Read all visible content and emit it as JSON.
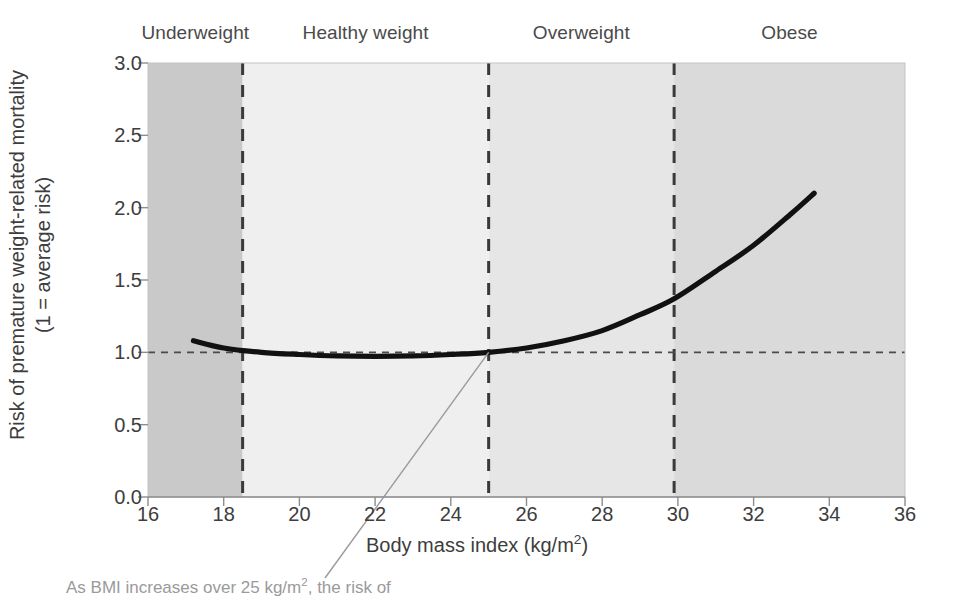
{
  "chart_data": {
    "type": "line",
    "title": "",
    "xlabel": "Body mass index (kg/m2)",
    "xlabel_base": "Body mass index (kg/m",
    "xlabel_sup": "2",
    "xlabel_tail": ")",
    "ylabel_line1": "Risk of premature weight-related mortality",
    "ylabel_line2": "(1 = average risk)",
    "xlim": [
      16,
      36
    ],
    "ylim": [
      0.0,
      3.0
    ],
    "xticks": [
      16,
      18,
      20,
      22,
      24,
      26,
      28,
      30,
      32,
      34,
      36
    ],
    "yticks": [
      "0.0",
      "0.5",
      "1.0",
      "1.5",
      "2.0",
      "2.5",
      "3.0"
    ],
    "grid": false,
    "legend": "none",
    "reference_line": {
      "y": 1.0,
      "style": "dashed",
      "label": "average risk"
    },
    "series": [
      {
        "name": "Risk of premature weight-related mortality",
        "color": "#111111",
        "x": [
          17.2,
          18.0,
          19.0,
          20.0,
          21.0,
          22.0,
          23.0,
          24.0,
          25.0,
          26.0,
          27.0,
          28.0,
          29.0,
          29.9,
          31.0,
          32.0,
          33.0,
          33.6
        ],
        "y": [
          1.08,
          1.03,
          1.0,
          0.985,
          0.975,
          0.972,
          0.975,
          0.985,
          1.0,
          1.03,
          1.08,
          1.15,
          1.26,
          1.37,
          1.56,
          1.74,
          1.96,
          2.1
        ]
      }
    ],
    "bands": [
      {
        "name": "Underweight",
        "label": "Underweight",
        "x0": 16.0,
        "x1": 18.5,
        "color": "#c9c9c9"
      },
      {
        "name": "Healthy weight",
        "label": "Healthy weight",
        "x0": 18.5,
        "x1": 25.0,
        "color": "#efefef"
      },
      {
        "name": "Overweight",
        "label": "Overweight",
        "x0": 25.0,
        "x1": 29.9,
        "color": "#e6e6e6"
      },
      {
        "name": "Obese",
        "label": "Obese",
        "x0": 29.9,
        "x1": 36.0,
        "color": "#dadada"
      }
    ],
    "band_dividers": [
      18.5,
      25.0,
      29.9
    ],
    "annotation": {
      "text": "As BMI increases over 25 kg/m2, the risk of",
      "text_base": "As BMI increases over 25 kg/m",
      "text_sup": "2",
      "text_tail": ", the risk of",
      "points_to": {
        "x": 25.0,
        "y": 1.0
      },
      "color": "#9a9a9a"
    }
  }
}
